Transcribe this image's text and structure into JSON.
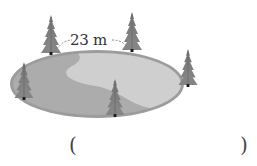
{
  "figure": {
    "distance_label": "23 m",
    "tree_count": 5,
    "colors": {
      "lake_rim": "#9a9a9a",
      "lake_dark": "#a8a8a8",
      "lake_light": "#cdcdcd",
      "tree": "#7d7d7d",
      "tree_dark": "#5f5f5f",
      "trunk": "#1a1a1a",
      "dashed_arc": "#666666"
    }
  },
  "answer": {
    "open_paren": "(",
    "close_paren": ")",
    "value": ""
  }
}
